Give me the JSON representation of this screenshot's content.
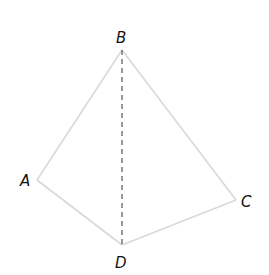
{
  "diagram": {
    "type": "geometry-figure",
    "vertices": [
      {
        "id": "A",
        "label": "A"
      },
      {
        "id": "B",
        "label": "B"
      },
      {
        "id": "C",
        "label": "C"
      },
      {
        "id": "D",
        "label": "D"
      }
    ],
    "edges": [
      {
        "from": "A",
        "to": "B",
        "style": "solid"
      },
      {
        "from": "B",
        "to": "C",
        "style": "solid"
      },
      {
        "from": "C",
        "to": "D",
        "style": "solid"
      },
      {
        "from": "D",
        "to": "A",
        "style": "solid"
      },
      {
        "from": "B",
        "to": "D",
        "style": "dashed"
      }
    ],
    "colors": {
      "edge": "#d9d9d9",
      "dashed": "#333333",
      "label": "#111111"
    }
  }
}
